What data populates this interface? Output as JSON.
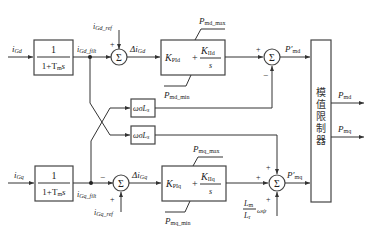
{
  "diagram": {
    "type": "control-block-diagram",
    "top_row": {
      "input": {
        "main": "i",
        "sub": "Gd"
      },
      "filter": {
        "num": "1",
        "den_main": "1+T",
        "den_sub": "m",
        "den_tail": "s"
      },
      "filtered": {
        "main": "i",
        "sub": "Gd_filt"
      },
      "ref": {
        "main": "i",
        "sub": "Gd_ref"
      },
      "ref_sign": "+",
      "error": {
        "main": "Δi",
        "sub": "Gd"
      },
      "pi": {
        "kp_main": "K",
        "kp_sub": "PId",
        "plus": "+",
        "ki_main": "K",
        "ki_sub": "IId",
        "den": "s"
      },
      "limit_max": {
        "main": "P",
        "sub": "md_max"
      },
      "limit_min": {
        "main": "P",
        "sub": "md_min"
      },
      "sum_in_sign": "+",
      "sum_fb_sign": "−",
      "output": {
        "main": "P′",
        "sub": "md"
      }
    },
    "bottom_row": {
      "input": {
        "main": "i",
        "sub": "Gq"
      },
      "filter": {
        "num": "1",
        "den_main": "1+T",
        "den_sub": "m",
        "den_tail": "s"
      },
      "filtered": {
        "main": "i",
        "sub": "Gq_filt"
      },
      "ref": {
        "main": "i",
        "sub": "Gq_ref"
      },
      "ref_sign": "+",
      "fb_sign": "−",
      "error": {
        "main": "Δi",
        "sub": "Gq"
      },
      "pi": {
        "kp_main": "K",
        "kp_sub": "PIq",
        "plus": "+",
        "ki_main": "K",
        "ki_sub": "IIq",
        "den": "s"
      },
      "limit_max": {
        "main": "P",
        "sub": "mq_max"
      },
      "limit_min": {
        "main": "P",
        "sub": "mq_min"
      },
      "sum_in_sign": "+",
      "sum_top_sign": "+",
      "sum_bottom_sign": "+",
      "feedforward": {
        "num_main": "L",
        "num_sub": "m",
        "den_main": "L",
        "den_sub": "r",
        "tail": "ωψ"
      },
      "output": {
        "main": "P′",
        "sub": "mq"
      }
    },
    "coupling": {
      "block_top": {
        "main": "ωσL",
        "sub": "s"
      },
      "block_bottom": {
        "main": "ωσL",
        "sub": "s"
      }
    },
    "sum_symbol": "Σ",
    "limiter": {
      "label": "模值限制器"
    },
    "outputs": [
      {
        "main": "P",
        "sub": "md"
      },
      {
        "main": "P",
        "sub": "mq"
      }
    ]
  }
}
